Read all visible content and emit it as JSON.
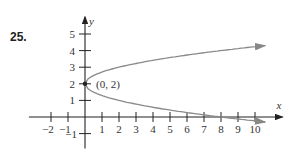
{
  "problem_number": "25.",
  "chart_data": {
    "type": "line",
    "title": "",
    "xlabel": "x",
    "ylabel": "y",
    "equation": "x = 2(y - 2)^2",
    "xlim": [
      -2.5,
      10.8
    ],
    "ylim": [
      -1.3,
      5.8
    ],
    "x_ticks": [
      -2,
      -1,
      1,
      2,
      3,
      4,
      5,
      6,
      7,
      8,
      9,
      10
    ],
    "y_ticks": [
      -1,
      1,
      2,
      3,
      4,
      5
    ],
    "annotations": [
      {
        "text": "(0, 2)",
        "x": 0,
        "y": 2
      }
    ],
    "series": [
      {
        "name": "upper branch",
        "x": [
          0,
          0.5,
          2,
          4.5,
          8,
          10.6
        ],
        "y": [
          2,
          2.5,
          3,
          3.5,
          4,
          4.3
        ]
      },
      {
        "name": "lower branch",
        "x": [
          0,
          0.5,
          2,
          4.5,
          8,
          10.6
        ],
        "y": [
          2,
          1.5,
          1,
          0.5,
          0,
          -0.3
        ]
      }
    ],
    "grid": false,
    "curve_color": "#8a8a8a"
  }
}
